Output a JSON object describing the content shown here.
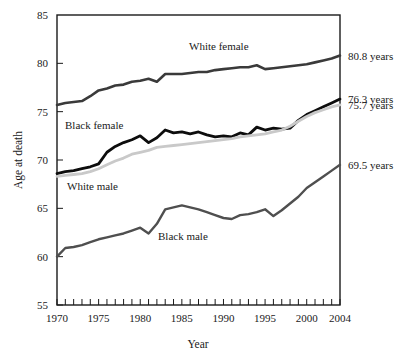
{
  "chart_data": {
    "type": "line",
    "title": "",
    "xlabel": "Year",
    "ylabel": "Age at death",
    "xlim": [
      1970,
      2004
    ],
    "ylim": [
      55,
      85
    ],
    "ytick_values": [
      55,
      60,
      65,
      70,
      75,
      80,
      85
    ],
    "ytick_labels": [
      "55",
      "60",
      "65",
      "70",
      "75",
      "80",
      "85"
    ],
    "xtick_values": [
      1970,
      1975,
      1980,
      1985,
      1990,
      1995,
      2000,
      2004
    ],
    "xtick_labels": [
      "1970",
      "1975",
      "1980",
      "1985",
      "1990",
      "1995",
      "2000",
      "2004"
    ],
    "xtick_minor_step": 1,
    "grid": false,
    "legend": "inline-annotations",
    "x": [
      1970,
      1971,
      1972,
      1973,
      1974,
      1975,
      1976,
      1977,
      1978,
      1979,
      1980,
      1981,
      1982,
      1983,
      1984,
      1985,
      1986,
      1987,
      1988,
      1989,
      1990,
      1991,
      1992,
      1993,
      1994,
      1995,
      1996,
      1997,
      1998,
      1999,
      2000,
      2001,
      2002,
      2003,
      2004
    ],
    "series": [
      {
        "name": "White female",
        "color": "#3a3a3a",
        "width": 2.6,
        "values": [
          75.7,
          75.9,
          76.0,
          76.1,
          76.6,
          77.2,
          77.4,
          77.7,
          77.8,
          78.1,
          78.2,
          78.4,
          78.1,
          78.9,
          78.9,
          78.9,
          79.0,
          79.1,
          79.1,
          79.3,
          79.4,
          79.5,
          79.6,
          79.6,
          79.8,
          79.4,
          79.5,
          79.6,
          79.7,
          79.8,
          79.9,
          80.1,
          80.3,
          80.5,
          80.8
        ],
        "end_label": "80.8 years"
      },
      {
        "name": "Black female",
        "color": "#0d0d0d",
        "width": 2.8,
        "values": [
          68.6,
          68.8,
          68.9,
          69.1,
          69.3,
          69.6,
          70.8,
          71.4,
          71.8,
          72.1,
          72.5,
          71.8,
          72.3,
          73.1,
          72.8,
          72.9,
          72.7,
          72.9,
          72.6,
          72.4,
          72.5,
          72.4,
          72.8,
          72.6,
          73.4,
          73.1,
          73.3,
          73.2,
          73.3,
          74.1,
          74.7,
          75.1,
          75.5,
          75.9,
          76.3
        ],
        "end_label": "76.3 years"
      },
      {
        "name": "White male",
        "color": "#c9c9c9",
        "width": 2.8,
        "values": [
          68.3,
          68.4,
          68.5,
          68.6,
          68.8,
          69.1,
          69.5,
          69.9,
          70.2,
          70.6,
          70.8,
          71.0,
          71.3,
          71.4,
          71.5,
          71.6,
          71.7,
          71.8,
          71.9,
          72.0,
          72.1,
          72.2,
          72.4,
          72.5,
          72.6,
          72.7,
          72.9,
          73.1,
          73.5,
          74.0,
          74.5,
          74.9,
          75.2,
          75.5,
          75.7
        ],
        "end_label": "75.7 years"
      },
      {
        "name": "Black male",
        "color": "#4f4f4f",
        "width": 2.4,
        "values": [
          60.0,
          60.9,
          61.0,
          61.2,
          61.5,
          61.8,
          62.0,
          62.2,
          62.4,
          62.7,
          63.0,
          62.4,
          63.4,
          64.9,
          65.1,
          65.3,
          65.1,
          64.9,
          64.6,
          64.3,
          64.0,
          63.9,
          64.3,
          64.4,
          64.6,
          64.9,
          64.2,
          64.8,
          65.5,
          66.2,
          67.1,
          67.7,
          68.3,
          68.9,
          69.5
        ],
        "end_label": "69.5 years"
      }
    ],
    "annotations": [
      {
        "text": "White female",
        "x_px": 189,
        "y_px": 50
      },
      {
        "text": "Black female",
        "x_px": 65,
        "y_px": 129
      },
      {
        "text": "White male",
        "x_px": 67,
        "y_px": 190
      },
      {
        "text": "Black male",
        "x_px": 158,
        "y_px": 240
      }
    ]
  }
}
